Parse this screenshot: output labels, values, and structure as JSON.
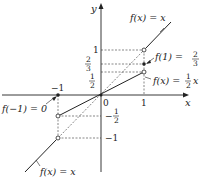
{
  "axes": {
    "x_label": "x",
    "y_label": "y",
    "origin_label": "0"
  },
  "ticks": {
    "x_one": "1",
    "x_neg_one": "−1",
    "y_one": "1",
    "y_two_thirds_num": "2",
    "y_two_thirds_den": "3",
    "y_half_num": "1",
    "y_half_den": "2",
    "y_neg_half_sign": "−",
    "y_neg_half_num": "1",
    "y_neg_half_den": "2",
    "y_neg_one": "−1"
  },
  "annotations": {
    "top_line": "f(x) = x",
    "f1_prefix": "f(1) =",
    "f1_num": "2",
    "f1_den": "3",
    "half_line_prefix": "f(x) =",
    "half_line_num": "1",
    "half_line_den": "2",
    "half_line_suffix": "x",
    "f_neg1": "f(−1) = 0",
    "bottom_line": "f(x) = x"
  },
  "colors": {
    "stroke": "#222222",
    "dash": "#555555"
  }
}
